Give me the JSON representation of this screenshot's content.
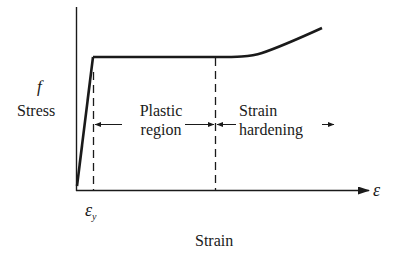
{
  "diagram": {
    "type": "stress-strain curve (elastic–perfectly plastic with strain hardening)",
    "y_axis": {
      "symbol": "f",
      "label": "Stress"
    },
    "x_axis": {
      "symbol": "ε",
      "label": "Strain"
    },
    "markers": {
      "yield_strain": {
        "symbol": "ε",
        "subscript": "y"
      }
    },
    "regions": [
      {
        "line1": "Plastic",
        "line2": "region"
      },
      {
        "line1": "Strain",
        "line2": "hardening"
      }
    ],
    "colors": {
      "ink": "#1a1a1a",
      "background": "#ffffff"
    }
  }
}
